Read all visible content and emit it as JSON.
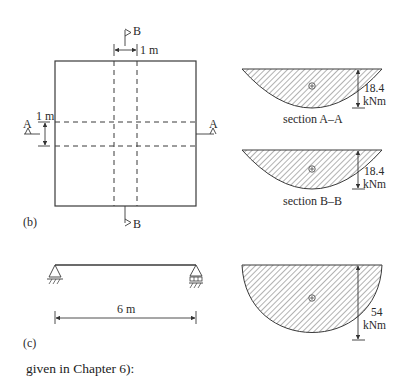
{
  "figure_b": {
    "label": "(b)",
    "section_mark_top": "B",
    "section_mark_bottom": "B",
    "section_mark_left": "A",
    "section_mark_right": "A",
    "dim_horizontal": "1 m",
    "dim_vertical": "1 m"
  },
  "figure_c": {
    "label": "(c)",
    "span_label": "6 m"
  },
  "moment_diagrams": [
    {
      "caption": "section A–A",
      "value": "18.4",
      "unit": "kNm",
      "sign": "+"
    },
    {
      "caption": "section B–B",
      "value": "18.4",
      "unit": "kNm",
      "sign": "+"
    },
    {
      "caption": "",
      "value": "54",
      "unit": "kNm",
      "sign": "+"
    }
  ],
  "body_text": "given in Chapter 6):",
  "colors": {
    "line": "#3a3a3a",
    "hatch": "#555555",
    "background": "#ffffff"
  }
}
